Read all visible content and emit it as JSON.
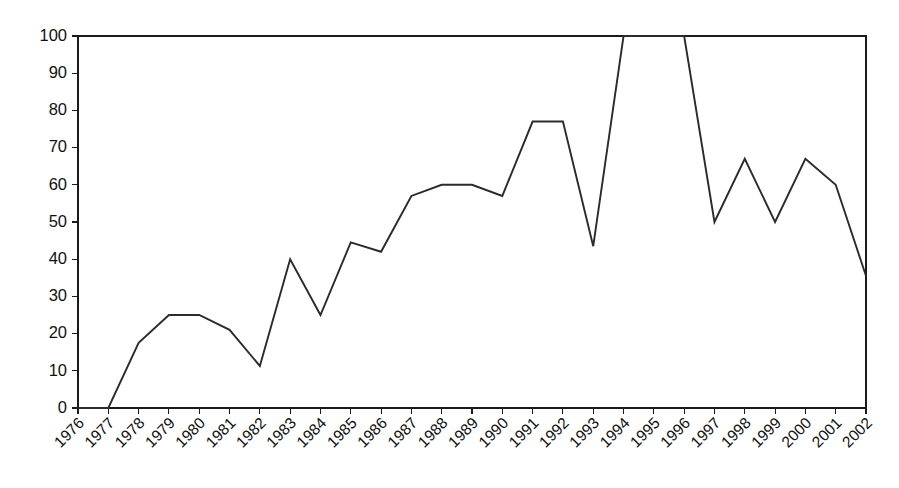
{
  "chart_data": {
    "type": "line",
    "title": "",
    "subtitle": "",
    "xlabel": "",
    "ylabel": "",
    "categories": [
      "1976",
      "1977",
      "1978",
      "1979",
      "1980",
      "1981",
      "1982",
      "1983",
      "1984",
      "1985",
      "1986",
      "1987",
      "1988",
      "1989",
      "1990",
      "1991",
      "1992",
      "1993",
      "1994",
      "1995",
      "1996",
      "1997",
      "1998",
      "1999",
      "2000",
      "2001",
      "2002"
    ],
    "values": [
      0,
      0,
      17.5,
      25,
      25,
      21,
      11.3,
      40,
      25,
      44.5,
      42,
      57,
      60,
      60,
      57,
      77,
      77,
      43.5,
      100,
      100,
      100,
      50,
      67,
      50,
      67,
      60,
      35.5
    ],
    "series": [
      {
        "name": "series-1",
        "color": "#2b2b2b",
        "values": [
          0,
          0,
          17.5,
          25,
          25,
          21,
          11.3,
          40,
          25,
          44.5,
          42,
          57,
          60,
          60,
          57,
          77,
          77,
          43.5,
          100,
          100,
          100,
          50,
          67,
          50,
          67,
          60,
          35.5
        ]
      }
    ],
    "ylim": [
      0,
      100
    ],
    "ytick_labels": [
      "0",
      "10",
      "20",
      "30",
      "40",
      "50",
      "60",
      "70",
      "80",
      "90",
      "100"
    ],
    "ytick_values": [
      0,
      10,
      20,
      30,
      40,
      50,
      60,
      70,
      80,
      90,
      100
    ],
    "xtick_labels": [
      "1976",
      "1977",
      "1978",
      "1979",
      "1980",
      "1981",
      "1982",
      "1983",
      "1984",
      "1985",
      "1986",
      "1987",
      "1988",
      "1989",
      "1990",
      "1991",
      "1992",
      "1993",
      "1994",
      "1995",
      "1996",
      "1997",
      "1998",
      "1999",
      "2000",
      "2001",
      "2002"
    ],
    "xtick_rotation_degrees": -45,
    "grid": false,
    "legend": false,
    "legend_position": "none",
    "markers": false,
    "line_color": "#2b2b2b",
    "axis_color": "#1a1a1a",
    "background_color": "#ffffff",
    "plot_border": true
  },
  "layout": {
    "plot_left": 78,
    "plot_right": 866,
    "plot_top": 36,
    "plot_bottom": 408
  }
}
